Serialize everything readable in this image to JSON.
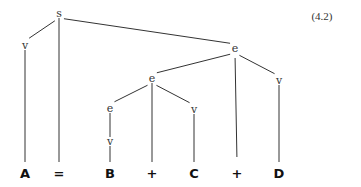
{
  "equation_number": "(4.2)",
  "colors": {
    "line": "#333333",
    "text": "#111111",
    "background": "#ffffff"
  },
  "nodes": [
    {
      "id": "s",
      "label": "s",
      "x": 59,
      "y": 14,
      "type": "internal"
    },
    {
      "id": "v1",
      "label": "v",
      "x": 25,
      "y": 46,
      "type": "internal"
    },
    {
      "id": "e1",
      "label": "e",
      "x": 235,
      "y": 49,
      "type": "internal"
    },
    {
      "id": "v2",
      "label": "v",
      "x": 279,
      "y": 81,
      "type": "internal"
    },
    {
      "id": "e2",
      "label": "e",
      "x": 152,
      "y": 79,
      "type": "internal"
    },
    {
      "id": "v3",
      "label": "v",
      "x": 194,
      "y": 110,
      "type": "internal"
    },
    {
      "id": "e3",
      "label": "e",
      "x": 110,
      "y": 109,
      "type": "internal"
    },
    {
      "id": "v4",
      "label": "v",
      "x": 110,
      "y": 142,
      "type": "internal"
    },
    {
      "id": "A",
      "label": "A",
      "x": 25,
      "y": 174,
      "type": "leaf"
    },
    {
      "id": "eq",
      "label": "=",
      "x": 59,
      "y": 174,
      "type": "leaf"
    },
    {
      "id": "B",
      "label": "B",
      "x": 110,
      "y": 174,
      "type": "leaf"
    },
    {
      "id": "p1",
      "label": "+",
      "x": 152,
      "y": 174,
      "type": "leaf"
    },
    {
      "id": "C",
      "label": "C",
      "x": 194,
      "y": 174,
      "type": "leaf"
    },
    {
      "id": "p2",
      "label": "+",
      "x": 237,
      "y": 174,
      "type": "leaf"
    },
    {
      "id": "D",
      "label": "D",
      "x": 279,
      "y": 174,
      "type": "leaf"
    }
  ],
  "edges": [
    {
      "from": "s",
      "to": "v1"
    },
    {
      "from": "s",
      "to": "eq"
    },
    {
      "from": "s",
      "to": "e1"
    },
    {
      "from": "v1",
      "to": "A"
    },
    {
      "from": "e1",
      "to": "e2"
    },
    {
      "from": "e1",
      "to": "p2"
    },
    {
      "from": "e1",
      "to": "v2"
    },
    {
      "from": "v2",
      "to": "D"
    },
    {
      "from": "e2",
      "to": "e3"
    },
    {
      "from": "e2",
      "to": "p1"
    },
    {
      "from": "e2",
      "to": "v3"
    },
    {
      "from": "v3",
      "to": "C"
    },
    {
      "from": "e3",
      "to": "v4"
    },
    {
      "from": "v4",
      "to": "B"
    }
  ]
}
